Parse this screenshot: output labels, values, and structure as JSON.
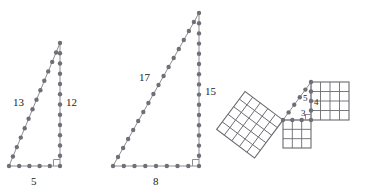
{
  "page": {
    "background": "#ffffff",
    "width": 390,
    "height": 195,
    "cut_off_top_text": ""
  },
  "style": {
    "edge_color": "#8d8d93",
    "dot_color": "#6f6f78",
    "grid_color": "#6a6a70",
    "label_color": "#1d1d1d"
  },
  "figures": [
    {
      "id": "triangle-5-12-13",
      "name": "right-triangle-dotted-5-12-13",
      "type": "right-triangle",
      "labels": {
        "hypotenuse": "13",
        "vertical_leg": "12",
        "horizontal_leg": "5"
      },
      "label_positions": {
        "hypotenuse": {
          "x": 13,
          "y": 97
        },
        "vertical_leg": {
          "x": 66,
          "y": 97
        },
        "horizontal_leg": {
          "x": 31,
          "y": 178
        }
      },
      "vertices": {
        "apex": {
          "x": 60,
          "y": 43
        },
        "right_angle": {
          "x": 60,
          "y": 166
        },
        "left": {
          "x": 9,
          "y": 166
        }
      },
      "dot_counts": {
        "hypotenuse": 14,
        "vertical_leg": 13,
        "horizontal_leg": 6
      },
      "right_angle_marker": true
    },
    {
      "id": "triangle-8-15-17",
      "name": "right-triangle-dotted-8-15-17",
      "type": "right-triangle",
      "labels": {
        "hypotenuse": "17",
        "vertical_leg": "15",
        "horizontal_leg": "8"
      },
      "label_positions": {
        "hypotenuse": {
          "x": 139,
          "y": 72
        },
        "vertical_leg": {
          "x": 205,
          "y": 86
        },
        "horizontal_leg": {
          "x": 153,
          "y": 178
        }
      },
      "vertices": {
        "apex": {
          "x": 199,
          "y": 13
        },
        "right_angle": {
          "x": 199,
          "y": 166
        },
        "left": {
          "x": 113,
          "y": 166
        }
      },
      "dot_counts": {
        "hypotenuse": 18,
        "vertical_leg": 16,
        "horizontal_leg": 9
      },
      "right_angle_marker": true
    },
    {
      "id": "squares-3-4-5",
      "name": "pythagorean-squares-3-4-5",
      "type": "pythagorean-squares",
      "labels": {
        "hypotenuse": "5",
        "vertical_leg": "4",
        "horizontal_leg": "3"
      },
      "label_positions": {
        "hypotenuse": {
          "x": 305,
          "y": 99
        },
        "vertical_leg": {
          "x": 316,
          "y": 103
        },
        "horizontal_leg": {
          "x": 303,
          "y": 114
        }
      },
      "squares": [
        {
          "name": "square-on-hypotenuse",
          "side_units": 5,
          "grid": "5x5",
          "orientation": "tilted"
        },
        {
          "name": "square-on-vertical-leg",
          "side_units": 4,
          "grid": "4x4",
          "orientation": "axis-aligned-right"
        },
        {
          "name": "square-on-horizontal-leg",
          "side_units": 3,
          "grid": "3x3",
          "orientation": "axis-aligned-below"
        }
      ],
      "triangle_vertices": {
        "top": {
          "x": 311,
          "y": 82
        },
        "right_angle": {
          "x": 311,
          "y": 120
        },
        "left": {
          "x": 283,
          "y": 120
        }
      },
      "right_angle_marker": true
    }
  ]
}
